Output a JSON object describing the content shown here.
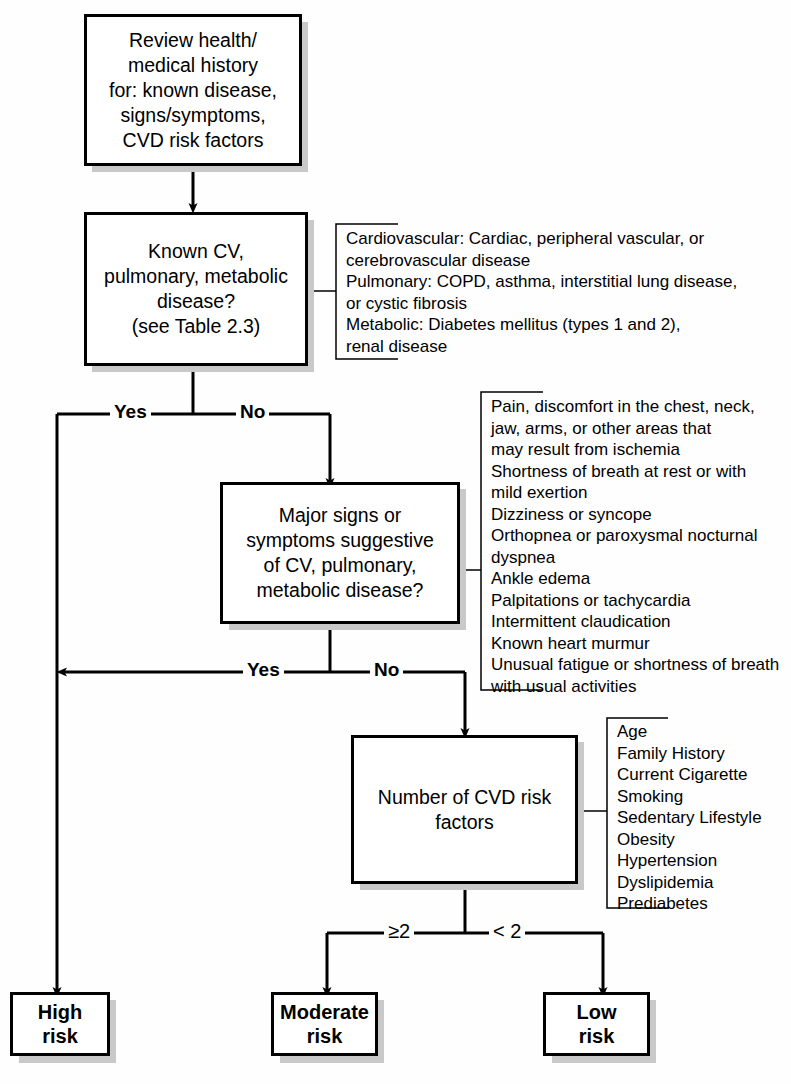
{
  "diagram": {
    "line_color": "#000000",
    "box_fill": "#ffffff",
    "shadow_color": "#c9c9c9"
  },
  "nodes": {
    "review": {
      "label": "Review health/\nmedical history\nfor: known disease,\nsigns/symptoms,\nCVD risk factors"
    },
    "known_disease": {
      "label": "Known CV,\npulmonary, metabolic\ndisease?\n(see Table 2.3)"
    },
    "major_signs": {
      "label": "Major signs or\nsymptoms suggestive\nof CV, pulmonary,\nmetabolic disease?"
    },
    "risk_factors": {
      "label": "Number of CVD risk\nfactors"
    },
    "high_risk": {
      "label": "High risk"
    },
    "moderate_risk": {
      "label": "Moderate\nrisk"
    },
    "low_risk": {
      "label": "Low\nrisk"
    }
  },
  "notes": {
    "disease_note": {
      "lines": "Cardiovascular: Cardiac, peripheral vascular, or\n    cerebrovascular disease\nPulmonary: COPD, asthma, interstitial lung disease,\n    or cystic fibrosis\nMetabolic: Diabetes mellitus (types 1 and 2),\n    renal disease"
    },
    "signs_note": {
      "lines": "Pain, discomfort in the chest, neck,\n     jaw, arms, or other areas that\n     may result from ischemia\nShortness of breath at rest or with\n     mild exertion\nDizziness or syncope\nOrthopnea or paroxysmal nocturnal\n     dyspnea\nAnkle edema\nPalpitations or tachycardia\nIntermittent claudication\nKnown heart murmur\nUnusual fatigue or shortness of breath\n     with usual activities"
    },
    "risk_note": {
      "lines": "Age\nFamily History\nCurrent Cigarette\n     Smoking\nSedentary Lifestyle\nObesity\nHypertension\nDyslipidemia\nPrediabetes"
    }
  },
  "edge_labels": {
    "yes_1": "Yes",
    "no_1": "No",
    "yes_2": "Yes",
    "no_2": "No",
    "ge_two": "≥2",
    "lt_two": "< 2"
  }
}
